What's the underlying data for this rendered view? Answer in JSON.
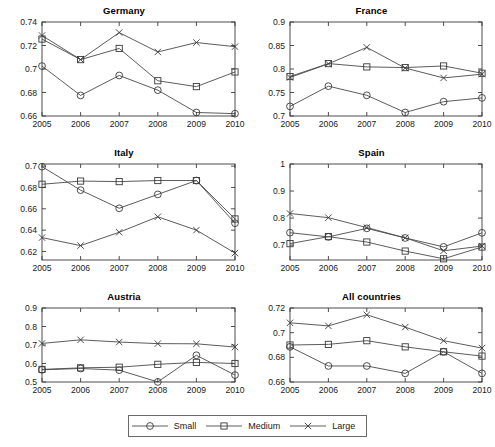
{
  "figure": {
    "width": 495,
    "height": 447,
    "background": "#ffffff",
    "line_color": "#4a4a4a",
    "axis_color": "#3a3a3a",
    "text_color": "#1a1a1a"
  },
  "legend": {
    "entries": [
      {
        "label": "Small",
        "marker": "circle-marker"
      },
      {
        "label": "Medium",
        "marker": "square-marker"
      },
      {
        "label": "Large",
        "marker": "cross-marker"
      }
    ]
  },
  "chart_data": [
    {
      "type": "line",
      "title": "Germany",
      "xlabel": "",
      "ylabel": "",
      "x": [
        2005,
        2006,
        2007,
        2008,
        2009,
        2010
      ],
      "categories": [
        "2005",
        "2006",
        "2007",
        "2008",
        "2009",
        "2010"
      ],
      "xlim": [
        2005,
        2010
      ],
      "ylim": [
        0.66,
        0.74
      ],
      "yticks": [
        0.66,
        0.68,
        0.7,
        0.72,
        0.74
      ],
      "yticklabels": [
        "0.66",
        "0.68",
        "0.7",
        "0.72",
        "0.74"
      ],
      "grid": false,
      "series": [
        {
          "name": "Small",
          "marker": "circle-marker",
          "values": [
            0.7025,
            0.6775,
            0.6945,
            0.682,
            0.663,
            0.662
          ]
        },
        {
          "name": "Medium",
          "marker": "square-marker",
          "values": [
            0.7255,
            0.708,
            0.7175,
            0.69,
            0.685,
            0.6975
          ]
        },
        {
          "name": "Large",
          "marker": "cross-marker",
          "values": [
            0.7285,
            0.708,
            0.731,
            0.7145,
            0.7225,
            0.719
          ]
        }
      ]
    },
    {
      "type": "line",
      "title": "France",
      "xlabel": "",
      "ylabel": "",
      "x": [
        2005,
        2006,
        2007,
        2008,
        2009,
        2010
      ],
      "categories": [
        "2005",
        "2006",
        "2007",
        "2008",
        "2009",
        "2010"
      ],
      "xlim": [
        2005,
        2010
      ],
      "ylim": [
        0.7,
        0.9
      ],
      "yticks": [
        0.7,
        0.75,
        0.8,
        0.85,
        0.9
      ],
      "yticklabels": [
        "0.7",
        "0.75",
        "0.8",
        "0.85",
        "0.9"
      ],
      "grid": false,
      "series": [
        {
          "name": "Small",
          "marker": "circle-marker",
          "values": [
            0.7205,
            0.7635,
            0.744,
            0.7075,
            0.7305,
            0.7385
          ]
        },
        {
          "name": "Medium",
          "marker": "square-marker",
          "values": [
            0.784,
            0.8115,
            0.8045,
            0.803,
            0.8065,
            0.791
          ]
        },
        {
          "name": "Large",
          "marker": "cross-marker",
          "values": [
            0.782,
            0.811,
            0.846,
            0.802,
            0.781,
            0.789
          ]
        }
      ]
    },
    {
      "type": "line",
      "title": "Italy",
      "xlabel": "",
      "ylabel": "",
      "x": [
        2005,
        2006,
        2007,
        2008,
        2009,
        2010
      ],
      "categories": [
        "2005",
        "2006",
        "2007",
        "2008",
        "2009",
        "2010"
      ],
      "xlim": [
        2005,
        2010
      ],
      "ylim": [
        0.612,
        0.702
      ],
      "yticks": [
        0.62,
        0.64,
        0.66,
        0.68,
        0.7
      ],
      "yticklabels": [
        "0.62",
        "0.64",
        "0.66",
        "0.68",
        "0.7"
      ],
      "grid": false,
      "series": [
        {
          "name": "Small",
          "marker": "circle-marker",
          "values": [
            0.6995,
            0.6775,
            0.6605,
            0.6735,
            0.6865,
            0.6465
          ]
        },
        {
          "name": "Medium",
          "marker": "square-marker",
          "values": [
            0.683,
            0.686,
            0.6855,
            0.6865,
            0.6865,
            0.6505
          ]
        },
        {
          "name": "Large",
          "marker": "cross-marker",
          "values": [
            0.633,
            0.6255,
            0.638,
            0.6525,
            0.64,
            0.6185
          ]
        }
      ]
    },
    {
      "type": "line",
      "title": "Spain",
      "xlabel": "",
      "ylabel": "",
      "x": [
        2005,
        2006,
        2007,
        2008,
        2009,
        2010
      ],
      "categories": [
        "2005",
        "2006",
        "2007",
        "2008",
        "2009",
        "2010"
      ],
      "xlim": [
        2005,
        2010
      ],
      "ylim": [
        0.645,
        1.0
      ],
      "yticks": [
        0.7,
        0.8,
        0.9,
        1.0
      ],
      "yticklabels": [
        "0.7",
        "0.8",
        "0.9",
        "1"
      ],
      "grid": false,
      "series": [
        {
          "name": "Small",
          "marker": "circle-marker",
          "values": [
            0.746,
            0.7305,
            0.762,
            0.7265,
            0.6935,
            0.7455
          ]
        },
        {
          "name": "Medium",
          "marker": "square-marker",
          "values": [
            0.7055,
            0.7315,
            0.7115,
            0.678,
            0.6495,
            0.693
          ]
        },
        {
          "name": "Large",
          "marker": "cross-marker",
          "values": [
            0.817,
            0.8015,
            0.765,
            0.727,
            0.679,
            0.6965
          ]
        }
      ]
    },
    {
      "type": "line",
      "title": "Austria",
      "xlabel": "",
      "ylabel": "",
      "x": [
        2005,
        2006,
        2007,
        2008,
        2009,
        2010
      ],
      "categories": [
        "2005",
        "2006",
        "2007",
        "2008",
        "2009",
        "2010"
      ],
      "xlim": [
        2005,
        2010
      ],
      "ylim": [
        0.5,
        0.9
      ],
      "yticks": [
        0.5,
        0.6,
        0.7,
        0.8,
        0.9
      ],
      "yticklabels": [
        "0.5",
        "0.6",
        "0.7",
        "0.8",
        "0.9"
      ],
      "grid": false,
      "series": [
        {
          "name": "Small",
          "marker": "circle-marker",
          "values": [
            0.566,
            0.573,
            0.564,
            0.5005,
            0.6445,
            0.5375
          ]
        },
        {
          "name": "Medium",
          "marker": "square-marker",
          "values": [
            0.568,
            0.5765,
            0.58,
            0.5955,
            0.606,
            0.6
          ]
        },
        {
          "name": "Large",
          "marker": "cross-marker",
          "values": [
            0.7085,
            0.728,
            0.716,
            0.7075,
            0.7065,
            0.689
          ]
        }
      ]
    },
    {
      "type": "line",
      "title": "All countries",
      "xlabel": "",
      "ylabel": "",
      "x": [
        2005,
        2006,
        2007,
        2008,
        2009,
        2010
      ],
      "categories": [
        "2005",
        "2006",
        "2007",
        "2008",
        "2009",
        "2010"
      ],
      "xlim": [
        2005,
        2010
      ],
      "ylim": [
        0.66,
        0.72
      ],
      "yticks": [
        0.66,
        0.68,
        0.7,
        0.72
      ],
      "yticklabels": [
        "0.66",
        "0.68",
        "0.7",
        "0.72"
      ],
      "grid": false,
      "series": [
        {
          "name": "Small",
          "marker": "circle-marker",
          "values": [
            0.6885,
            0.673,
            0.673,
            0.667,
            0.6845,
            0.667
          ]
        },
        {
          "name": "Medium",
          "marker": "square-marker",
          "values": [
            0.69,
            0.6905,
            0.6935,
            0.6885,
            0.6845,
            0.681
          ]
        },
        {
          "name": "Large",
          "marker": "cross-marker",
          "values": [
            0.708,
            0.7055,
            0.7145,
            0.7045,
            0.6935,
            0.6875
          ]
        }
      ]
    }
  ]
}
